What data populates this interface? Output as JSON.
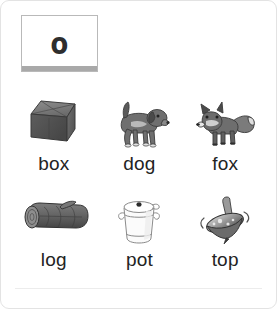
{
  "card": {
    "letter_box": {
      "letter": "o",
      "base_color": "#a9a9a9",
      "border_color": "#b9b9b9"
    },
    "label_color": "#232323"
  },
  "picture_grid": {
    "rows": [
      [
        {
          "icon": "cardboard-box-illustration",
          "label": "box"
        },
        {
          "icon": "dog-illustration",
          "label": "dog"
        },
        {
          "icon": "fox-illustration",
          "label": "fox"
        }
      ],
      [
        {
          "icon": "log-illustration",
          "label": "log"
        },
        {
          "icon": "pot-illustration",
          "label": "pot"
        },
        {
          "icon": "spinning-top-illustration",
          "label": "top"
        }
      ]
    ]
  }
}
